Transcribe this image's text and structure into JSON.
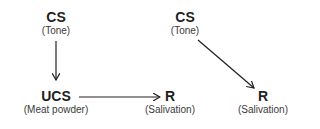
{
  "diagram": {
    "left": {
      "cs": {
        "label": "CS",
        "sub": "(Tone)"
      },
      "ucs": {
        "label": "UCS",
        "sub": "(Meat powder)"
      },
      "r": {
        "label": "R",
        "sub": "(Salivation)"
      }
    },
    "right": {
      "cs": {
        "label": "CS",
        "sub": "(Tone)"
      },
      "r": {
        "label": "R",
        "sub": "(Salivation)"
      }
    },
    "colors": {
      "stroke": "#231f20"
    }
  }
}
